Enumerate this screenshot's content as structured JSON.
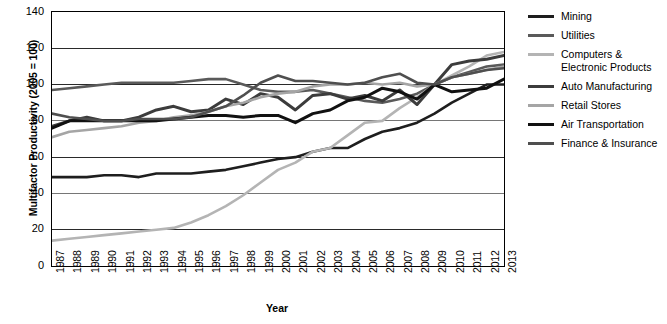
{
  "chart_data": {
    "type": "line",
    "title": "",
    "xlabel": "Year",
    "ylabel": "Multifactor Productivity (2005 = 100)",
    "xlim": [
      1987,
      2013
    ],
    "ylim": [
      0,
      140
    ],
    "yticks": [
      0,
      20,
      40,
      60,
      80,
      100,
      120,
      140
    ],
    "grid": true,
    "legend_position": "right",
    "x": [
      1987,
      1988,
      1989,
      1990,
      1991,
      1992,
      1993,
      1994,
      1995,
      1996,
      1997,
      1998,
      1999,
      2000,
      2001,
      2002,
      2003,
      2004,
      2005,
      2006,
      2007,
      2008,
      2009,
      2010,
      2011,
      2012,
      2013
    ],
    "categories": [
      "1987",
      "1988",
      "1989",
      "1990",
      "1991",
      "1992",
      "1993",
      "1994",
      "1995",
      "1996",
      "1997",
      "1998",
      "1999",
      "2000",
      "2001",
      "2002",
      "2003",
      "2004",
      "2005",
      "2006",
      "2007",
      "2008",
      "2009",
      "2010",
      "2011",
      "2012",
      "2013"
    ],
    "series": [
      {
        "name": "Mining",
        "color": "#1e1e1e",
        "width": 2.6,
        "values": [
          49,
          49,
          49,
          50,
          50,
          49,
          51,
          51,
          51,
          52,
          53,
          55,
          57,
          59,
          60,
          63,
          65,
          65,
          70,
          74,
          76,
          79,
          84,
          90,
          95,
          100,
          100
        ]
      },
      {
        "name": "Utilities",
        "color": "#5a5a5a",
        "width": 2.6,
        "values": [
          97,
          98,
          99,
          100,
          101,
          101,
          101,
          101,
          102,
          103,
          103,
          100,
          97,
          96,
          96,
          97,
          95,
          93,
          91,
          90,
          92,
          95,
          100,
          104,
          107,
          110,
          111
        ]
      },
      {
        "name": "Computers & Electronic Products",
        "color": "#b4b4b4",
        "width": 2.6,
        "values": [
          14,
          15,
          16,
          17,
          18,
          19,
          20,
          21,
          24,
          28,
          33,
          39,
          46,
          53,
          57,
          63,
          65,
          72,
          79,
          80,
          87,
          93,
          100,
          105,
          110,
          116,
          118
        ]
      },
      {
        "name": "Auto Manufacturing",
        "color": "#3c3c3c",
        "width": 3.0,
        "values": [
          77,
          80,
          82,
          80,
          80,
          82,
          86,
          88,
          85,
          86,
          92,
          89,
          95,
          93,
          86,
          94,
          95,
          92,
          94,
          91,
          97,
          89,
          100,
          111,
          113,
          114,
          116
        ]
      },
      {
        "name": "Retail Stores",
        "color": "#a5a5a5",
        "width": 2.6,
        "values": [
          71,
          74,
          75,
          76,
          77,
          79,
          80,
          82,
          83,
          85,
          88,
          90,
          93,
          95,
          96,
          99,
          100,
          100,
          101,
          100,
          101,
          99,
          100,
          104,
          106,
          108,
          110
        ]
      },
      {
        "name": "Air Transportation",
        "color": "#111111",
        "width": 3.0,
        "values": [
          76,
          80,
          80,
          80,
          80,
          80,
          80,
          81,
          82,
          83,
          83,
          82,
          83,
          83,
          79,
          84,
          86,
          91,
          93,
          98,
          96,
          92,
          100,
          96,
          97,
          98,
          103
        ]
      },
      {
        "name": "Finance & Insurance",
        "color": "#4f4f4f",
        "width": 2.6,
        "values": [
          84,
          82,
          81,
          80,
          80,
          81,
          81,
          81,
          82,
          85,
          88,
          94,
          101,
          105,
          102,
          102,
          101,
          100,
          101,
          104,
          106,
          101,
          100,
          104,
          106,
          108,
          109
        ]
      }
    ]
  },
  "legend": {
    "items": [
      {
        "label": "Mining"
      },
      {
        "label": "Utilities"
      },
      {
        "label": "Computers &\nElectronic Products"
      },
      {
        "label": "Auto Manufacturing"
      },
      {
        "label": "Retail Stores"
      },
      {
        "label": "Air Transportation"
      },
      {
        "label": "Finance & Insurance"
      }
    ]
  },
  "axes": {
    "y_title": "Multifactor Productivity (2005 = 100)",
    "x_title": "Year"
  }
}
